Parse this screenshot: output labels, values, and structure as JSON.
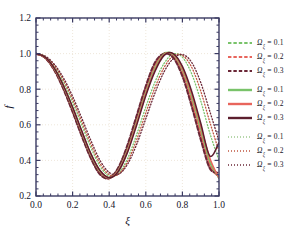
{
  "chart_data": {
    "type": "line",
    "title": "",
    "xlabel": "ξ",
    "ylabel": "f",
    "xlim": [
      0.0,
      1.0
    ],
    "ylim": [
      0.2,
      1.2
    ],
    "xticks": [
      "0.0",
      "0.2",
      "0.4",
      "0.6",
      "0.8",
      "1.0"
    ],
    "yticks": [
      "0.2",
      "0.4",
      "0.6",
      "0.8",
      "1.0",
      "1.2"
    ],
    "grid": true,
    "grid_style": "dotted",
    "grid_color": "#e8dccb",
    "legend_position": "right",
    "frame_color": "#3b3b63",
    "x": [
      0.0,
      0.05,
      0.1,
      0.15,
      0.2,
      0.25,
      0.3,
      0.35,
      0.4,
      0.45,
      0.5,
      0.55,
      0.6,
      0.65,
      0.7,
      0.75,
      0.8,
      0.85,
      0.9,
      0.95,
      1.0
    ],
    "series": [
      {
        "name": "Ωξ = 0.1",
        "omega": 0.1,
        "style": "dashed",
        "color": "#79c36a",
        "values": [
          1.0,
          0.978,
          0.912,
          0.81,
          0.685,
          0.55,
          0.424,
          0.332,
          0.302,
          0.352,
          0.47,
          0.63,
          0.795,
          0.93,
          1.0,
          0.99,
          0.9,
          0.745,
          0.56,
          0.385,
          0.302
        ]
      },
      {
        "name": "Ωξ = 0.2",
        "omega": 0.2,
        "style": "dashed",
        "color": "#e8655c",
        "values": [
          1.0,
          0.977,
          0.909,
          0.805,
          0.678,
          0.543,
          0.417,
          0.325,
          0.3,
          0.355,
          0.478,
          0.64,
          0.806,
          0.94,
          1.0,
          0.985,
          0.888,
          0.727,
          0.54,
          0.368,
          0.31
        ]
      },
      {
        "name": "Ωξ = 0.3",
        "omega": 0.3,
        "style": "dashed",
        "color": "#6b2737",
        "values": [
          1.0,
          0.976,
          0.906,
          0.8,
          0.672,
          0.536,
          0.411,
          0.321,
          0.3,
          0.36,
          0.487,
          0.652,
          0.818,
          0.95,
          1.0,
          0.977,
          0.873,
          0.706,
          0.518,
          0.355,
          0.33
        ]
      },
      {
        "name": "Ωξ = 0.1",
        "omega": 0.1,
        "style": "solid",
        "color": "#79c36a",
        "values": [
          1.0,
          0.979,
          0.915,
          0.816,
          0.693,
          0.558,
          0.43,
          0.337,
          0.302,
          0.345,
          0.458,
          0.615,
          0.78,
          0.915,
          0.998,
          0.995,
          0.912,
          0.765,
          0.582,
          0.4,
          0.3
        ]
      },
      {
        "name": "Ωξ = 0.2",
        "omega": 0.2,
        "style": "solid",
        "color": "#e8655c",
        "values": [
          1.0,
          0.979,
          0.916,
          0.818,
          0.696,
          0.562,
          0.434,
          0.34,
          0.303,
          0.342,
          0.452,
          0.607,
          0.772,
          0.908,
          0.994,
          0.998,
          0.92,
          0.777,
          0.595,
          0.412,
          0.3
        ]
      },
      {
        "name": "Ωξ = 0.3",
        "omega": 0.3,
        "style": "solid",
        "color": "#5c1f2e",
        "values": [
          1.0,
          0.98,
          0.918,
          0.821,
          0.7,
          0.566,
          0.438,
          0.343,
          0.303,
          0.338,
          0.445,
          0.598,
          0.763,
          0.9,
          0.99,
          1.0,
          0.928,
          0.79,
          0.61,
          0.425,
          0.5
        ]
      },
      {
        "name": "Ωξ = 0.1",
        "omega": 0.1,
        "style": "dotted",
        "color": "#79c36a",
        "values": [
          1.0,
          0.982,
          0.928,
          0.84,
          0.727,
          0.599,
          0.472,
          0.367,
          0.312,
          0.327,
          0.41,
          0.545,
          0.7,
          0.84,
          0.945,
          0.998,
          0.98,
          0.888,
          0.735,
          0.553,
          0.4
        ]
      },
      {
        "name": "Ωξ = 0.2",
        "omega": 0.2,
        "style": "dotted",
        "color": "#c0553f",
        "values": [
          1.0,
          0.984,
          0.934,
          0.852,
          0.743,
          0.618,
          0.491,
          0.382,
          0.32,
          0.322,
          0.392,
          0.516,
          0.666,
          0.808,
          0.922,
          0.987,
          0.99,
          0.925,
          0.79,
          0.615,
          0.45
        ]
      },
      {
        "name": "Ωξ = 0.3",
        "omega": 0.3,
        "style": "dotted",
        "color": "#6b2737",
        "values": [
          1.0,
          0.986,
          0.94,
          0.864,
          0.76,
          0.638,
          0.512,
          0.4,
          0.332,
          0.322,
          0.378,
          0.49,
          0.634,
          0.778,
          0.898,
          0.972,
          0.995,
          0.952,
          0.838,
          0.675,
          0.51
        ]
      }
    ]
  },
  "legend": {
    "groups": [
      {
        "style": "dashed",
        "rows": [
          {
            "symbol": "Ω",
            "sub": "ξ",
            "eq": "= 0.1",
            "color": "#79c36a",
            "full": "Ωξ = 0.1"
          },
          {
            "symbol": "Ω",
            "sub": "ξ",
            "eq": "= 0.2",
            "color": "#e8655c",
            "full": "Ωξ = 0.2"
          },
          {
            "symbol": "Ω",
            "sub": "ξ",
            "eq": "= 0.3",
            "color": "#6b2737",
            "full": "Ωξ = 0.3"
          }
        ]
      },
      {
        "style": "solid",
        "rows": [
          {
            "symbol": "Ω",
            "sub": "ξ",
            "eq": "= 0.1",
            "color": "#79c36a",
            "full": "Ωξ = 0.1"
          },
          {
            "symbol": "Ω",
            "sub": "ξ",
            "eq": "= 0.2",
            "color": "#e8655c",
            "full": "Ωξ = 0.2"
          },
          {
            "symbol": "Ω",
            "sub": "ξ",
            "eq": "= 0.3",
            "color": "#5c1f2e",
            "full": "Ωξ = 0.3"
          }
        ]
      },
      {
        "style": "dotted",
        "rows": [
          {
            "symbol": "Ω",
            "sub": "ξ",
            "eq": "= 0.1",
            "color": "#9ec98f",
            "full": "Ωξ = 0.1"
          },
          {
            "symbol": "Ω",
            "sub": "ξ",
            "eq": "= 0.2",
            "color": "#c0553f",
            "full": "Ωξ = 0.2"
          },
          {
            "symbol": "Ω",
            "sub": "ξ",
            "eq": "= 0.3",
            "color": "#6b2737",
            "full": "Ωξ = 0.3"
          }
        ]
      }
    ]
  }
}
